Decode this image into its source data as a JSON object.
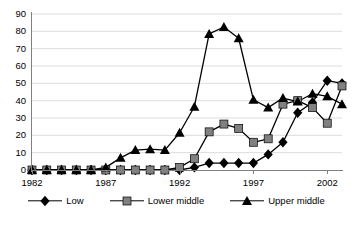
{
  "chart_data": {
    "type": "line",
    "title": "",
    "subtitle": "",
    "xlabel": "",
    "ylabel": "",
    "xlim": [
      1982,
      2003
    ],
    "ylim": [
      0,
      90
    ],
    "y_ticks": [
      0,
      10,
      20,
      30,
      40,
      50,
      60,
      70,
      80,
      90
    ],
    "x_ticks": [
      1982,
      1987,
      1992,
      1997,
      2002
    ],
    "x_tick_labels": [
      "1982",
      "1987",
      "1992",
      "1997",
      "2002"
    ],
    "grid": "horizontal",
    "legend_position": "bottom",
    "x": [
      1982,
      1983,
      1984,
      1985,
      1986,
      1987,
      1988,
      1989,
      1990,
      1991,
      1992,
      1993,
      1994,
      1995,
      1996,
      1997,
      1998,
      1999,
      2000,
      2001,
      2002,
      2003
    ],
    "series": [
      {
        "name": "Low",
        "marker": "diamond",
        "color": "#000000",
        "values": [
          0,
          0,
          0,
          0,
          0,
          0,
          0,
          0,
          0,
          0,
          0,
          1.5,
          4,
          4,
          4,
          4,
          9,
          16,
          33,
          39,
          51.5,
          50
        ]
      },
      {
        "name": "Lower middle",
        "marker": "square",
        "color": "#808080",
        "values": [
          0,
          0,
          0,
          0,
          0,
          0,
          0,
          0,
          0,
          0,
          1.5,
          6.5,
          22,
          26.5,
          24,
          16,
          18,
          38,
          40,
          36,
          27,
          48.5
        ]
      },
      {
        "name": "Upper middle",
        "marker": "triangle",
        "color": "#000000",
        "values": [
          0,
          0,
          0,
          0,
          0,
          1.5,
          7,
          11.5,
          12,
          11.5,
          21.5,
          36.5,
          78.5,
          82.5,
          76,
          40.5,
          36,
          41.5,
          39.5,
          44,
          42.5,
          38
        ]
      }
    ]
  },
  "legend": {
    "items": [
      {
        "label": "Low",
        "marker": "diamond-marker"
      },
      {
        "label": "Lower middle",
        "marker": "square-marker"
      },
      {
        "label": "Upper middle",
        "marker": "triangle-marker"
      }
    ]
  }
}
